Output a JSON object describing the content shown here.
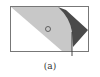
{
  "figure": {
    "caption": "(a)",
    "colors": {
      "frame": "#777777",
      "light_region": "#c8c8c8",
      "dark_region": "#4a4a4a",
      "background": "#ffffff",
      "marker": "#555555"
    },
    "elements": [
      "rectangular-frame",
      "light-gray-diagonal-region",
      "dark-gray-wedge",
      "circle-marker",
      "vertical-line"
    ]
  }
}
